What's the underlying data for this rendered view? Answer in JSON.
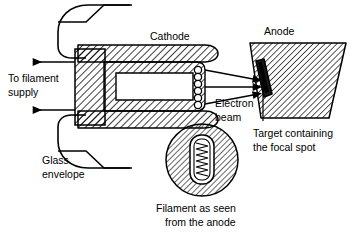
{
  "figure": {
    "background_color": "#ffffff",
    "line_color": "#000000",
    "hatch_color": "#000000"
  },
  "labels": {
    "cathode": "Cathode",
    "anode": "Anode",
    "to_filament_supply_line1": "To filament",
    "to_filament_supply_line2": "supply",
    "electron_beam_line1": "Electron",
    "electron_beam_line2": "beam",
    "glass_envelope_line1": "Glass",
    "glass_envelope_line2": "envelope",
    "target_line1": "Target containing",
    "target_line2": "the focal spot",
    "inset_caption_line1": "Filament as seen",
    "inset_caption_line2": "from the anode"
  },
  "components": {
    "glass_envelope": "glass envelope outline with rounded left end and stepped necks",
    "cathode_block": "solid hatched cathode support block",
    "cathode_arms": "two hatched arms with rounded right ends",
    "focusing_cup": "hatched focusing cup surrounding the filament",
    "filament_coil_turns": 7,
    "electron_beam_arrow_count": 3,
    "anode": "hatched parallelogram tilted anode disc",
    "target": "dark narrow parallelogram target insert on anode face",
    "inset_circle": "hatched circular view of filament as seen from anode",
    "inset_coil_turns": 8
  }
}
